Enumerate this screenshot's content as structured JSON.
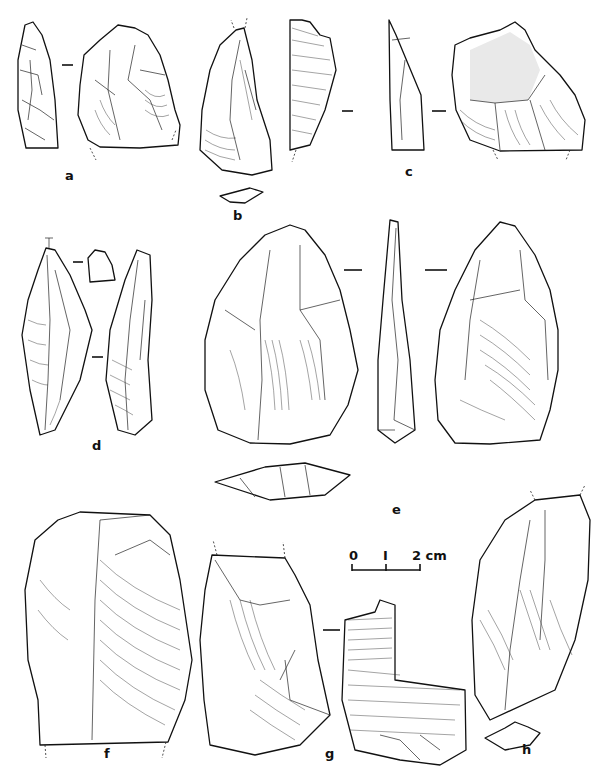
{
  "figure": {
    "labels": {
      "a": "a",
      "b": "b",
      "c": "c",
      "d": "d",
      "e": "e",
      "f": "f",
      "g": "g",
      "h": "h"
    },
    "scale_bar": {
      "tick_0": "0",
      "tick_1": "I",
      "tick_2": "2 cm"
    },
    "artifacts": [
      {
        "id": "a",
        "views": [
          "profile",
          "dorsal"
        ]
      },
      {
        "id": "b",
        "views": [
          "dorsal",
          "section"
        ]
      },
      {
        "id": "c",
        "views": [
          "ventral-fragment",
          "profile",
          "dorsal-with-cortex"
        ]
      },
      {
        "id": "d",
        "views": [
          "dorsal",
          "platform",
          "profile"
        ]
      },
      {
        "id": "e",
        "views": [
          "face-1",
          "profile",
          "face-2",
          "section"
        ]
      },
      {
        "id": "f",
        "views": [
          "dorsal"
        ]
      },
      {
        "id": "g",
        "views": [
          "dorsal",
          "ventral-fragment"
        ]
      },
      {
        "id": "h",
        "views": [
          "dorsal",
          "section"
        ]
      }
    ],
    "colors": {
      "ink": "#111111",
      "paper": "#ffffff"
    }
  }
}
